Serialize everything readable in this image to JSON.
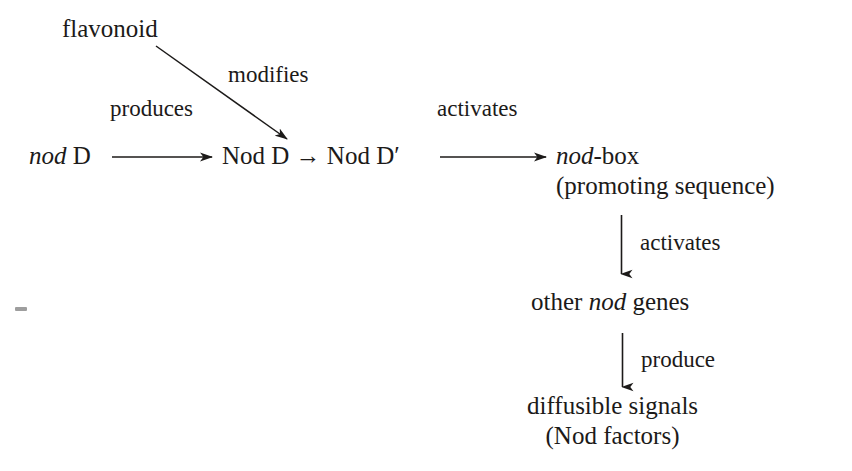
{
  "diagram": {
    "background_color": "#ffffff",
    "ink_color": "#1c1a19",
    "nodes": {
      "flavonoid": "flavonoid",
      "nod_d_gene": "nod D",
      "nod_d_gene_italic": "nod",
      "nod_d_gene_rest": " D",
      "nod_d_protein": "Nod D → Nod D′",
      "nod_box_italic": "nod",
      "nod_box_rest": "-box",
      "nod_box_sub": "(promoting sequence)",
      "other_nod_genes_pre": "other ",
      "other_nod_genes_italic": "nod",
      "other_nod_genes_post": " genes",
      "diffusible_signals": "diffusible signals",
      "diffusible_signals_sub": "(Nod factors)"
    },
    "edges": {
      "modifies": "modifies",
      "produces": "produces",
      "activates_top": "activates",
      "activates_down": "activates",
      "produce_down": "produce"
    }
  }
}
